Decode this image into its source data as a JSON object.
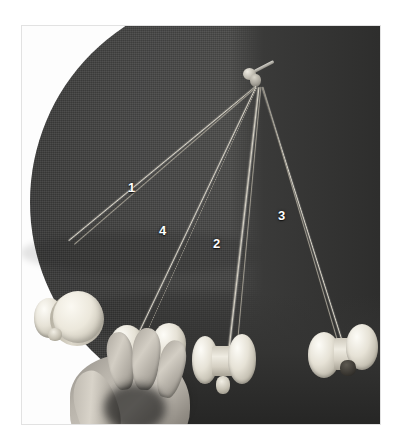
{
  "image": {
    "kind": "photograph",
    "subject": "four-pendulum-demonstration",
    "caption_text": "",
    "frame": {
      "border_color": "#e2e2e2",
      "background_color": "#ffffff"
    }
  },
  "scene": {
    "backdrop": {
      "name": "dark circular cloth",
      "color": "#454544",
      "shadow_color": "#2e2e2d"
    },
    "suspension": {
      "name": "common suspension hook",
      "parts": [
        "hook-shaft",
        "bead",
        "knot"
      ],
      "color": "#bdb9ae"
    },
    "string_color": "#d8d4c8",
    "bob_color": "#e6e2d6",
    "hand": {
      "name": "hand holding bob",
      "skin_tone": "#c5c0b7"
    }
  },
  "labels": [
    {
      "id": "label-1",
      "text": "1",
      "x": 127,
      "y": 180,
      "pendulum": "longest-left"
    },
    {
      "id": "label-4",
      "text": "4",
      "x": 158,
      "y": 223,
      "pendulum": "short-held-by-hand"
    },
    {
      "id": "label-2",
      "text": "2",
      "x": 212,
      "y": 236,
      "pendulum": "center"
    },
    {
      "id": "label-3",
      "text": "3",
      "x": 277,
      "y": 208,
      "pendulum": "right"
    }
  ],
  "pendulums": [
    {
      "number": "1",
      "label_text": "1",
      "bob_shape": "flat disc spool",
      "description": "longest string swinging far to the left, disc-faced bob at lower left"
    },
    {
      "number": "2",
      "label_text": "2",
      "bob_shape": "bobbin spool",
      "description": "near-vertical centre string, hourglass spool bob with knot beneath"
    },
    {
      "number": "3",
      "label_text": "3",
      "bob_shape": "bobbin spool",
      "description": "string angled to the right, spool bob at lower right"
    },
    {
      "number": "4",
      "label_text": "4",
      "bob_shape": "bobbin spool",
      "description": "shortest string, bob gripped between fingers of the hand"
    }
  ]
}
